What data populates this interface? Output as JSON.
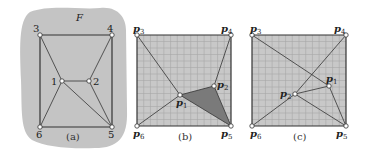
{
  "figure": {
    "panels": [
      {
        "id": "a",
        "caption": "(a)",
        "region_label": "F",
        "vertices": [
          {
            "label": "1",
            "x": 62,
            "y": 81
          },
          {
            "label": "2",
            "x": 89,
            "y": 81
          },
          {
            "label": "3",
            "x": 40,
            "y": 35
          },
          {
            "label": "4",
            "x": 112,
            "y": 35
          },
          {
            "label": "5",
            "x": 112,
            "y": 127
          },
          {
            "label": "6",
            "x": 40,
            "y": 127
          }
        ],
        "edges": [
          [
            "3",
            "4"
          ],
          [
            "4",
            "5"
          ],
          [
            "5",
            "6"
          ],
          [
            "6",
            "3"
          ],
          [
            "1",
            "2"
          ],
          [
            "1",
            "3"
          ],
          [
            "1",
            "6"
          ],
          [
            "1",
            "5"
          ],
          [
            "2",
            "4"
          ],
          [
            "2",
            "5"
          ]
        ]
      },
      {
        "id": "b",
        "caption": "(b)",
        "vertices": [
          {
            "label": "p1",
            "x": 180,
            "y": 95
          },
          {
            "label": "p2",
            "x": 214,
            "y": 86
          },
          {
            "label": "p3",
            "x": 137,
            "y": 35
          },
          {
            "label": "p4",
            "x": 231,
            "y": 35
          },
          {
            "label": "p5",
            "x": 231,
            "y": 126
          },
          {
            "label": "p6",
            "x": 137,
            "y": 126
          }
        ],
        "edges": [
          [
            "p3",
            "p4"
          ],
          [
            "p4",
            "p5"
          ],
          [
            "p5",
            "p6"
          ],
          [
            "p6",
            "p3"
          ],
          [
            "p1",
            "p2"
          ],
          [
            "p1",
            "p3"
          ],
          [
            "p1",
            "p6"
          ],
          [
            "p1",
            "p5"
          ],
          [
            "p2",
            "p4"
          ],
          [
            "p2",
            "p5"
          ]
        ],
        "shaded_triangle": [
          "p1",
          "p2",
          "p5"
        ]
      },
      {
        "id": "c",
        "caption": "(c)",
        "vertices": [
          {
            "label": "p1",
            "x": 329,
            "y": 86
          },
          {
            "label": "p2",
            "x": 295,
            "y": 94
          },
          {
            "label": "p3",
            "x": 252,
            "y": 35
          },
          {
            "label": "p4",
            "x": 346,
            "y": 35
          },
          {
            "label": "p5",
            "x": 346,
            "y": 126
          },
          {
            "label": "p6",
            "x": 252,
            "y": 126
          }
        ],
        "edges": [
          [
            "p3",
            "p4"
          ],
          [
            "p4",
            "p5"
          ],
          [
            "p5",
            "p6"
          ],
          [
            "p6",
            "p3"
          ],
          [
            "p1",
            "p2"
          ],
          [
            "p1",
            "p3"
          ],
          [
            "p1",
            "p5"
          ],
          [
            "p2",
            "p4"
          ],
          [
            "p2",
            "p6"
          ],
          [
            "p2",
            "p5"
          ]
        ]
      }
    ],
    "colors": {
      "region_fill": "#c4c4c4",
      "square_fill": "#c8c8c8",
      "grid": "#a8a8a8",
      "edge": "#333333",
      "shaded": "#7a7a7a",
      "vertex_fill": "#ffffff"
    }
  }
}
